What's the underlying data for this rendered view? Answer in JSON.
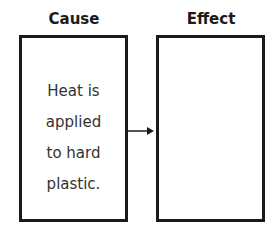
{
  "diagram": {
    "cause": {
      "heading": "Cause",
      "lines": [
        "Heat is",
        "applied",
        "to hard",
        "plastic."
      ]
    },
    "effect": {
      "heading": "Effect",
      "text": ""
    },
    "connector": "arrow-right"
  }
}
